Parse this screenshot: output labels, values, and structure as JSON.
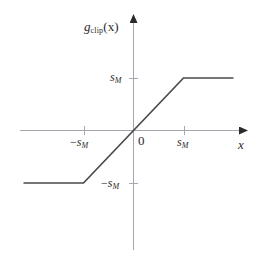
{
  "figure": {
    "kind": "function-plot",
    "background_color": "#ffffff",
    "line_color": "#3a3a3a",
    "axis_color": "#9a9aa5",
    "text_color": "#2b2b2b"
  },
  "labels": {
    "y_axis_function": "g",
    "y_axis_function_sub": "clip",
    "y_axis_function_arg": "(x)",
    "x_axis": "x",
    "origin": "0",
    "tick_x_positive_base": "s",
    "tick_x_positive_sub": "M",
    "tick_x_negative_sign": "−",
    "tick_x_negative_base": "s",
    "tick_x_negative_sub": "M",
    "tick_y_positive_base": "s",
    "tick_y_positive_sub": "M",
    "tick_y_negative_sign": "−",
    "tick_y_negative_base": "s",
    "tick_y_negative_sub": "M"
  },
  "chart_data": {
    "type": "line",
    "title": "",
    "xlabel": "x",
    "ylabel": "g_clip(x)",
    "grid": false,
    "legend": null,
    "xlim": [
      -2.3,
      2.1
    ],
    "ylim": [
      -2.3,
      2.3
    ],
    "xticks": [
      -1,
      0,
      1
    ],
    "xticklabels": [
      "−s_M",
      "0",
      "s_M"
    ],
    "yticks": [
      -1,
      1
    ],
    "yticklabels": [
      "−s_M",
      "s_M"
    ],
    "series": [
      {
        "name": "g_clip(x)",
        "description": "Clipping / saturation function: linear with unit slope for |x| <= s_M, constant at ±s_M outside",
        "x": [
          -2.2,
          -1.0,
          0.0,
          1.0,
          2.0
        ],
        "y": [
          -1.0,
          -1.0,
          0.0,
          1.0,
          1.0
        ]
      }
    ],
    "annotations": [
      {
        "text": "−s_M",
        "x": -1.0,
        "y": 0.0,
        "role": "x-tick"
      },
      {
        "text": "0",
        "x": 0.0,
        "y": 0.0,
        "role": "origin"
      },
      {
        "text": "s_M",
        "x": 1.0,
        "y": 0.0,
        "role": "x-tick"
      },
      {
        "text": "s_M",
        "x": 0.0,
        "y": 1.0,
        "role": "y-tick"
      },
      {
        "text": "−s_M",
        "x": 0.0,
        "y": -1.0,
        "role": "y-tick"
      }
    ]
  }
}
